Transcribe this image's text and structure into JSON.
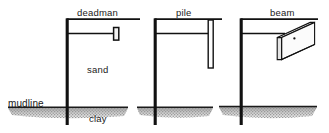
{
  "figure": {
    "colors": {
      "ink": "#1a1a1a",
      "line": "#111111",
      "soil_band": "#9a9a9a",
      "background": "#ffffff",
      "beam_face": "#fbfbfb"
    },
    "panels": [
      {
        "id": "deadman",
        "label": "deadman",
        "anchor_type": "deadman anchor block",
        "soil_upper": "sand",
        "soil_lower": "clay",
        "ground_label": "mudline"
      },
      {
        "id": "pile",
        "label": "pile",
        "anchor_type": "anchor pile",
        "soil_upper": "",
        "soil_lower": "",
        "ground_label": ""
      },
      {
        "id": "beam",
        "label": "beam",
        "anchor_type": "anchor beam",
        "soil_upper": "",
        "soil_lower": "",
        "ground_label": ""
      }
    ],
    "labels": {
      "deadman": "deadman",
      "pile": "pile",
      "beam": "beam",
      "sand": "sand",
      "clay": "clay",
      "mudline": "mudline"
    }
  }
}
